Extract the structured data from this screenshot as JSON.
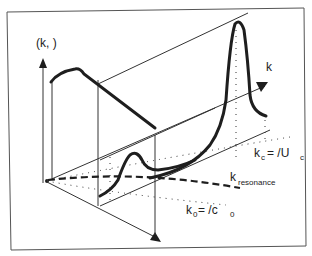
{
  "diagram": {
    "type": "3d-spectrum-sketch",
    "labels": {
      "vertical_axis": "(k,   )",
      "k_axis": "k",
      "kc_main": "k",
      "kc_sub": "c",
      "kc_eq": "=   /U",
      "kc_eq_sub": "c",
      "kres_main": "k",
      "kres_sub": "resonance",
      "k0_main": "k",
      "k0_sub": "0",
      "k0_eq": "=   /c",
      "k0_eq_sub": "0"
    },
    "colors": {
      "ink": "#1e1e1e",
      "thin": "#333333",
      "frame": "#555555",
      "background": "#ffffff"
    },
    "elements": [
      "frame",
      "vertical-axis-arrow",
      "k-axis-arrow",
      "omega-axis-arrow",
      "low-frequency-spectrum-curve",
      "high-frequency-spectrum-curve",
      "convective-ridge-line-kc",
      "acoustic-line-k0",
      "resonance-dashed-curve"
    ]
  }
}
